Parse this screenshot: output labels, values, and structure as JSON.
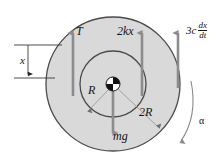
{
  "figure": {
    "type": "mechanics-free-body-diagram",
    "canvas": {
      "width": 224,
      "height": 159
    },
    "colors": {
      "disc_fill": "#d9d9d9",
      "disc_stroke": "#4a4a4a",
      "arrow": "#8c8c8c",
      "leader": "#9a9a9a",
      "text": "#141414",
      "background": "#ffffff",
      "hub_dark": "#111111",
      "hub_light": "#ffffff"
    },
    "geometry": {
      "center": {
        "x": 113,
        "y": 84
      },
      "outer_radius": 67,
      "inner_radius": 33,
      "hub_radius": 7
    },
    "labels": {
      "tension": "T",
      "spring_force": "2kx",
      "weight": "mg",
      "inner_radius_label": "R",
      "outer_radius_label": "2R",
      "displacement": "x",
      "angular_accel": "α",
      "damping_coefficient": "3c",
      "damping_numerator": "dx",
      "damping_denominator": "dt"
    },
    "forces": [
      {
        "name": "tension",
        "label": "T",
        "direction": "up",
        "x": 73,
        "from_y": 96,
        "to_y": 30
      },
      {
        "name": "spring-force",
        "label": "2kx",
        "x": 142,
        "direction": "up",
        "from_y": 96,
        "to_y": 30
      },
      {
        "name": "damping-force",
        "label": "3c dx/dt",
        "x": 178,
        "direction": "up",
        "from_y": 88,
        "to_y": 30
      },
      {
        "name": "weight",
        "label": "mg",
        "x": 113,
        "direction": "down",
        "from_y": 84,
        "to_y": 136
      }
    ],
    "dimension": {
      "name": "x",
      "label": "x",
      "vertical_line_x": 28,
      "top_y": 45,
      "bottom_y": 78,
      "upper_extension_to_x": 62,
      "lower_extension_to_x": 55
    },
    "arc": {
      "name": "angular-acceleration-arc",
      "label": "α",
      "direction": "counterclockwise-down"
    }
  }
}
